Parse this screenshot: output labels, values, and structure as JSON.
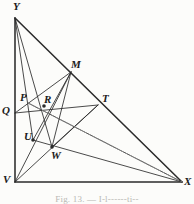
{
  "figure": {
    "caption": "Fig. 13. — I-l------ti--",
    "stroke_color": "#2b2b2b",
    "dashed_color": "#8a8a8a",
    "background_color": "#fcfcfa",
    "label_color": "#1b1b1b"
  },
  "vertices": {
    "Y": {
      "label": "Y",
      "x": 15,
      "y": 18,
      "lx": 13,
      "ly": 1
    },
    "V": {
      "label": "V",
      "x": 15,
      "y": 182,
      "lx": 3,
      "ly": 174
    },
    "X": {
      "label": "X",
      "x": 182,
      "y": 182,
      "lx": 184,
      "ly": 176
    }
  },
  "points": {
    "M": {
      "label": "M",
      "x": 71,
      "y": 72,
      "lx": 71,
      "ly": 59
    },
    "T": {
      "label": "T",
      "x": 98,
      "y": 105,
      "lx": 102,
      "ly": 93
    },
    "P": {
      "label": "P",
      "x": 28,
      "y": 103,
      "lx": 20,
      "ly": 92
    },
    "Q": {
      "label": "Q",
      "x": 15,
      "y": 113,
      "lx": 2,
      "ly": 105
    },
    "R": {
      "label": "R",
      "x": 44,
      "y": 106,
      "lx": 44,
      "ly": 94
    },
    "U": {
      "label": "U",
      "x": 33,
      "y": 140,
      "lx": 24,
      "ly": 131
    },
    "W": {
      "label": "W",
      "x": 52,
      "y": 147,
      "lx": 51,
      "ly": 150
    }
  },
  "solid_segments": [
    {
      "name": "side-YV",
      "from": "Y",
      "to": "V"
    },
    {
      "name": "side-VX",
      "from": "V",
      "to": "X"
    },
    {
      "name": "side-YX",
      "from": "Y",
      "to": "X"
    },
    {
      "name": "cevian-Y-W",
      "from": "Y",
      "to": "W"
    },
    {
      "name": "cevian-Y-U",
      "from": "Y",
      "to": "U"
    },
    {
      "name": "cevian-V-M",
      "from": "V",
      "to": "M"
    },
    {
      "name": "cevian-V-T",
      "from": "V",
      "to": "T"
    },
    {
      "name": "segment-Q-T",
      "from": "Q",
      "to": "T"
    },
    {
      "name": "segment-Q-M",
      "from": "Q",
      "to": "M"
    },
    {
      "name": "segment-U-X",
      "from": "U",
      "to": "X"
    },
    {
      "name": "segment-M-U",
      "from": "M",
      "to": "U"
    },
    {
      "name": "segment-M-W",
      "from": "M",
      "to": "W"
    },
    {
      "name": "segment-T-W",
      "from": "T",
      "to": "W"
    },
    {
      "name": "segment-P-X",
      "from": "P",
      "to": "X"
    }
  ],
  "dashed_segments": [
    {
      "name": "dashed-P-X",
      "from": "P",
      "to": "X"
    }
  ],
  "marked_points": [
    "R",
    "U",
    "W"
  ]
}
